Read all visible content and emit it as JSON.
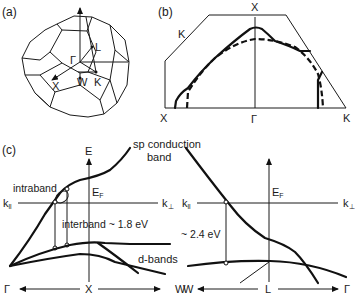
{
  "panel_a": {
    "label": "(a)",
    "points": {
      "gamma": "Γ",
      "L": "L",
      "X": "X",
      "W": "W",
      "K": "K"
    }
  },
  "panel_b": {
    "label": "(b)",
    "points": {
      "K_left": "K",
      "X_top": "X",
      "X_bottom": "X",
      "gamma": "Γ",
      "K_right": "K"
    }
  },
  "panel_c": {
    "label": "(c)",
    "left": {
      "axis_E": "E",
      "fermi": "E",
      "fermi_sub": "F",
      "k_par": "k",
      "k_par_sub": "ll",
      "k_perp": "k",
      "k_perp_sub": "⊥",
      "intraband": "intraband",
      "interband": "interband ~ 1.8 eV",
      "sp_band_1": "sp conduction",
      "sp_band_2": "band",
      "d_bands": "d-bands",
      "axis_left": "Γ",
      "axis_mid": "X",
      "axis_right": "W"
    },
    "right": {
      "fermi": "E",
      "fermi_sub": "F",
      "k_par": "k",
      "k_par_sub": "ll",
      "k_perp": "k",
      "k_perp_sub": "⊥",
      "gap": "~ 2.4 eV",
      "axis_left": "W",
      "axis_mid": "L",
      "axis_right": "Γ"
    }
  },
  "colors": {
    "line": "#111111",
    "background": "#ffffff"
  }
}
